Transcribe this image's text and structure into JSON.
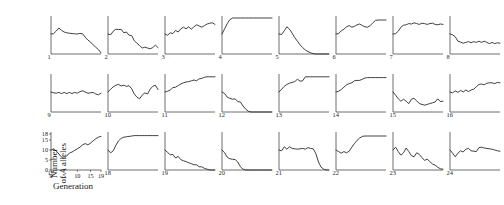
{
  "figure": {
    "type": "small-multiples-line-grid",
    "panel_count": 24,
    "columns": 8,
    "rows": 3
  },
  "axes": {
    "ylabel_line1": "Number",
    "ylabel_line2_prefix": "of ",
    "ylabel_line2_italic": "A",
    "ylabel_line2_suffix": " alleles",
    "ylabel_full": "Number of A alleles",
    "xlabel": "Generation",
    "yticks": [
      0,
      5,
      10,
      15,
      18
    ],
    "xticks": [
      0,
      5,
      10,
      15,
      19
    ],
    "ylim": [
      0,
      18
    ],
    "xlim": [
      0,
      19
    ],
    "labelled_panel": "17"
  },
  "style": {
    "line_color": "#2a2a2a",
    "axis_color": "#4a4a4a",
    "background": "#ffffff"
  },
  "chart_data": {
    "type": "line",
    "title": "",
    "xlabel": "Generation",
    "ylabel": "Number of A alleles",
    "xlim": [
      0,
      19
    ],
    "ylim": [
      0,
      18
    ],
    "xticks": [
      0,
      5,
      10,
      15,
      19
    ],
    "yticks": [
      0,
      5,
      10,
      15,
      18
    ],
    "grid": false,
    "legend": "none",
    "x": [
      0,
      1,
      2,
      3,
      4,
      5,
      6,
      7,
      8,
      9,
      10,
      11,
      12,
      13,
      14,
      15,
      16,
      17,
      18,
      19
    ],
    "series": [
      {
        "name": "1",
        "label": "1",
        "values": [
          10,
          10.2,
          11.5,
          13,
          11.8,
          11,
          10.6,
          10.4,
          10.2,
          10.1,
          10,
          10.3,
          10.1,
          8.4,
          7,
          6,
          4.6,
          3.4,
          2.2,
          0.6
        ]
      },
      {
        "name": "2",
        "label": "2",
        "values": [
          10,
          9.6,
          11.4,
          12.4,
          12.2,
          12.3,
          10.6,
          11,
          9.4,
          9.2,
          6.6,
          5.4,
          4.2,
          3,
          3.4,
          3,
          2.6,
          3.2,
          4.4,
          3.2
        ]
      },
      {
        "name": "3",
        "label": "3",
        "values": [
          10,
          9.4,
          10.6,
          10.2,
          11.8,
          11,
          12.6,
          13.4,
          12.6,
          13.6,
          12.4,
          13.6,
          14.6,
          14,
          13.4,
          14.2,
          15,
          15.4,
          15.6,
          14.8
        ]
      },
      {
        "name": "4",
        "label": "4",
        "values": [
          10,
          12.6,
          15.2,
          17.2,
          18,
          18,
          18,
          18,
          18,
          18,
          18,
          18,
          18,
          18,
          18,
          18,
          18,
          18,
          18,
          18
        ]
      },
      {
        "name": "5",
        "label": "5",
        "values": [
          10,
          9.8,
          11.6,
          13.6,
          12.4,
          10.4,
          8.2,
          6.4,
          4.6,
          3.2,
          2,
          1.2,
          0.6,
          0.2,
          0,
          0,
          0,
          0,
          0,
          0
        ]
      },
      {
        "name": "6",
        "label": "6",
        "values": [
          10,
          10.2,
          11.6,
          12.4,
          13.6,
          14.2,
          13.4,
          13.8,
          14.6,
          15,
          14.2,
          13.6,
          13.4,
          14.2,
          15.6,
          16.8,
          17,
          17,
          17,
          17
        ]
      },
      {
        "name": "7",
        "label": "7",
        "values": [
          10,
          10.2,
          11.4,
          13.4,
          14.4,
          14.6,
          15.2,
          15,
          15.6,
          15.2,
          14.8,
          15.4,
          15.2,
          14.8,
          15.2,
          15.4,
          14.8,
          14.6,
          15,
          14.8
        ]
      },
      {
        "name": "8",
        "label": "8",
        "values": [
          10,
          9.6,
          8.6,
          6.4,
          6,
          5.4,
          5.8,
          6.2,
          5.6,
          6.2,
          5.8,
          6.4,
          5.8,
          6.4,
          5.8,
          5.2,
          5.8,
          5.2,
          5.6,
          5.4
        ]
      },
      {
        "name": "9",
        "label": "9",
        "values": [
          10,
          9.6,
          9.4,
          9.8,
          9.2,
          9.8,
          9.2,
          9.8,
          9.2,
          9.8,
          9.4,
          10.2,
          10.6,
          10,
          9.4,
          9.6,
          9.8,
          9,
          8.6,
          9.4
        ]
      },
      {
        "name": "10",
        "label": "10",
        "values": [
          10,
          11.4,
          12.6,
          13.4,
          13.8,
          13,
          13.4,
          12.8,
          13.2,
          11.6,
          9,
          7.4,
          6.6,
          8.4,
          9.6,
          9,
          11.4,
          12.8,
          13.4,
          11.2
        ]
      },
      {
        "name": "11",
        "label": "11",
        "values": [
          10,
          10.4,
          11,
          12.2,
          12.4,
          13.2,
          14,
          14.6,
          15,
          15.2,
          15.6,
          16,
          15.6,
          16.6,
          16.8,
          17.4,
          17.6,
          17.6,
          17.6,
          17.6
        ]
      },
      {
        "name": "12",
        "label": "12",
        "values": [
          10,
          9.2,
          7.4,
          6.8,
          6.4,
          6.6,
          5.2,
          5,
          3,
          1.4,
          0.4,
          0,
          0,
          0,
          0,
          0,
          0,
          0,
          0,
          0
        ]
      },
      {
        "name": "13",
        "label": "13",
        "values": [
          10,
          11.4,
          12.8,
          13.8,
          14.4,
          14.8,
          15.2,
          16.4,
          15.4,
          15.6,
          17.6,
          17.6,
          17.6,
          17.6,
          17.6,
          17.6,
          17.6,
          17.6,
          17.6,
          17.6
        ]
      },
      {
        "name": "14",
        "label": "14",
        "values": [
          10,
          10.4,
          11.2,
          12.4,
          13.6,
          14.2,
          14.6,
          15.6,
          15.8,
          15.8,
          16.4,
          17,
          17.2,
          17.2,
          17.2,
          17.2,
          17.2,
          17.2,
          17.2,
          17.2
        ]
      },
      {
        "name": "15",
        "label": "15",
        "values": [
          10,
          8.4,
          6.6,
          5.4,
          6.4,
          5.4,
          4.2,
          6.4,
          6.8,
          5.6,
          4.2,
          3.8,
          3.4,
          3.8,
          4.2,
          4.6,
          5,
          6.6,
          5.2,
          5.4
        ]
      },
      {
        "name": "16",
        "label": "16",
        "values": [
          10,
          9.6,
          10.6,
          9.8,
          10.8,
          10,
          11,
          10.2,
          11,
          11.4,
          12.6,
          13.8,
          14,
          13.6,
          14.4,
          14.6,
          14.6,
          14.2,
          14.8,
          14.6
        ]
      },
      {
        "name": "17",
        "label": "17",
        "values": [
          10,
          10.4,
          9.6,
          8,
          6.4,
          5.8,
          7.2,
          8.4,
          9,
          9.8,
          10.6,
          11.4,
          12.6,
          13.2,
          12.6,
          13.4,
          14.6,
          15.6,
          16.4,
          16.8
        ]
      },
      {
        "name": "18",
        "label": "18",
        "values": [
          10,
          8.6,
          9.6,
          12.4,
          14.6,
          15.8,
          16.4,
          16.6,
          16.8,
          17,
          17.2,
          17.2,
          17.2,
          17.2,
          17.2,
          17.2,
          17.2,
          17.2,
          17.2,
          17.2
        ]
      },
      {
        "name": "19",
        "label": "19",
        "values": [
          10,
          8.8,
          7.6,
          7.8,
          6,
          6.8,
          5.2,
          4.6,
          4.2,
          3.6,
          3.2,
          2.6,
          2.6,
          1.6,
          1.6,
          0.8,
          0.4,
          0,
          0,
          0
        ]
      },
      {
        "name": "20",
        "label": "20",
        "values": [
          10,
          8.6,
          6.4,
          5.6,
          5.4,
          5.2,
          4,
          1.6,
          0.4,
          0,
          0,
          0,
          0,
          0,
          0,
          0,
          0,
          0,
          0,
          0
        ]
      },
      {
        "name": "21",
        "label": "21",
        "values": [
          10,
          9.6,
          11.6,
          10.4,
          11.6,
          10.8,
          10.6,
          10.4,
          10.6,
          10.8,
          10.4,
          11.2,
          10.8,
          10.6,
          8.2,
          4,
          1.4,
          0.4,
          0,
          0
        ]
      },
      {
        "name": "22",
        "label": "22",
        "values": [
          10,
          9.2,
          8.4,
          9.2,
          8.6,
          9.4,
          11.4,
          13.2,
          14.8,
          16,
          16.8,
          17,
          17,
          17,
          17,
          17,
          17,
          17,
          17,
          17
        ]
      },
      {
        "name": "23",
        "label": "23",
        "values": [
          10,
          11.4,
          9.2,
          7.4,
          8.6,
          11,
          9.2,
          7.2,
          6.6,
          8.6,
          7.8,
          6.2,
          4.8,
          5.4,
          4.2,
          3,
          2.4,
          1.4,
          0.6,
          0.4
        ]
      },
      {
        "name": "24",
        "label": "24",
        "values": [
          10,
          8.4,
          6.6,
          8.4,
          9.6,
          9,
          10.4,
          10.8,
          9.6,
          9.4,
          9.2,
          11.2,
          11.4,
          11,
          10.8,
          10.6,
          10.4,
          10,
          9.6,
          9.4
        ]
      }
    ]
  }
}
